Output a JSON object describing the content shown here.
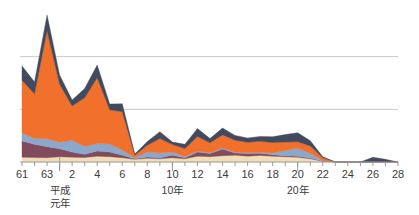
{
  "chart_data": {
    "type": "area",
    "stacked": true,
    "title": "",
    "subtitle": "",
    "xlabel": "",
    "ylabel": "",
    "grid": true,
    "gridlines_y": [
      2,
      4
    ],
    "ylim": [
      0,
      6
    ],
    "legend_position": "none",
    "x": [
      "61",
      "62",
      "63",
      "1",
      "2",
      "3",
      "4",
      "5",
      "6",
      "7",
      "8",
      "9",
      "10",
      "11",
      "12",
      "13",
      "14",
      "15",
      "16",
      "17",
      "18",
      "19",
      "20",
      "21",
      "22",
      "23",
      "24",
      "25",
      "26",
      "27",
      "28"
    ],
    "x_tick_labels": [
      "61",
      "",
      "63",
      "",
      "2",
      "",
      "4",
      "",
      "6",
      "",
      "8",
      "",
      "10",
      "",
      "12",
      "",
      "14",
      "",
      "16",
      "",
      "18",
      "",
      "20",
      "",
      "22",
      "",
      "24",
      "",
      "26",
      "",
      "28"
    ],
    "era_labels": [
      {
        "text_lines": [
          "平成",
          "元年"
        ],
        "at_x": "1"
      },
      {
        "text_lines": [
          "10年"
        ],
        "at_x": "10"
      },
      {
        "text_lines": [
          "20年"
        ],
        "at_x": "20"
      }
    ],
    "era_dividers": [
      "1"
    ],
    "series": [
      {
        "name": "series-cream",
        "color": "#f3ddb4",
        "values": [
          0.18,
          0.17,
          0.16,
          0.2,
          0.18,
          0.17,
          0.22,
          0.2,
          0.16,
          0.1,
          0.14,
          0.12,
          0.16,
          0.12,
          0.22,
          0.2,
          0.24,
          0.26,
          0.22,
          0.25,
          0.22,
          0.2,
          0.18,
          0.12,
          0.03,
          0.0,
          0.0,
          0.0,
          0.0,
          0.0,
          0.0
        ]
      },
      {
        "name": "series-maroon",
        "color": "#7f4b5d",
        "values": [
          0.62,
          0.5,
          0.42,
          0.3,
          0.2,
          0.12,
          0.2,
          0.18,
          0.1,
          0.02,
          0.05,
          0.04,
          0.1,
          0.04,
          0.16,
          0.12,
          0.25,
          0.08,
          0.1,
          0.08,
          0.06,
          0.04,
          0.04,
          0.03,
          0.01,
          0.0,
          0.0,
          0.0,
          0.0,
          0.0,
          0.0
        ]
      },
      {
        "name": "series-lightblue",
        "color": "#8ca7cc",
        "values": [
          0.3,
          0.22,
          0.3,
          0.25,
          0.45,
          0.3,
          0.28,
          0.3,
          0.2,
          0.04,
          0.2,
          0.18,
          0.12,
          0.05,
          0.04,
          0.03,
          0.04,
          0.03,
          0.03,
          0.04,
          0.06,
          0.2,
          0.3,
          0.18,
          0.02,
          0.0,
          0.0,
          0.0,
          0.0,
          0.0,
          0.0
        ]
      },
      {
        "name": "series-orange",
        "color": "#f1702b",
        "values": [
          2.0,
          1.7,
          4.1,
          2.2,
          1.3,
          1.85,
          2.5,
          1.3,
          1.45,
          0.1,
          0.25,
          0.55,
          0.28,
          0.3,
          0.55,
          0.38,
          0.5,
          0.46,
          0.4,
          0.42,
          0.4,
          0.32,
          0.25,
          0.28,
          0.1,
          0.0,
          0.0,
          0.0,
          0.0,
          0.0,
          0.0
        ]
      },
      {
        "name": "series-navy",
        "color": "#424a5d",
        "values": [
          0.55,
          0.45,
          0.6,
          0.35,
          0.22,
          0.35,
          0.48,
          0.22,
          0.3,
          0.04,
          0.14,
          0.26,
          0.1,
          0.16,
          0.3,
          0.16,
          0.26,
          0.18,
          0.16,
          0.18,
          0.22,
          0.28,
          0.34,
          0.2,
          0.04,
          0.0,
          0.0,
          0.0,
          0.18,
          0.1,
          0.0
        ]
      }
    ],
    "colors": {
      "cream": "#f3ddb4",
      "maroon": "#7f4b5d",
      "lightblue": "#8ca7cc",
      "orange": "#f1702b",
      "navy": "#424a5d",
      "gridline": "#c9c9c9",
      "axis": "#9a9a9a",
      "text": "#3c3c3c",
      "background": "#ffffff"
    }
  }
}
